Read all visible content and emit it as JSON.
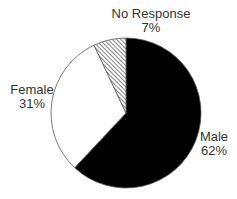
{
  "chart_data": {
    "type": "pie",
    "title": "",
    "start_angle_deg": 0,
    "direction": "clockwise",
    "slices": [
      {
        "label": "Male",
        "value": 62,
        "display": "62%",
        "fill": "#000000",
        "pattern": "solid"
      },
      {
        "label": "Female",
        "value": 31,
        "display": "31%",
        "fill": "#ffffff",
        "pattern": "solid"
      },
      {
        "label": "No Response",
        "value": 7,
        "display": "7%",
        "fill": "#ffffff",
        "pattern": "diagonal-hatch"
      }
    ],
    "legend": "none",
    "labels_position": "outside"
  },
  "labels": {
    "male": {
      "name": "Male",
      "pct": "62%"
    },
    "female": {
      "name": "Female",
      "pct": "31%"
    },
    "no_response": {
      "name": "No Response",
      "pct": "7%"
    }
  }
}
